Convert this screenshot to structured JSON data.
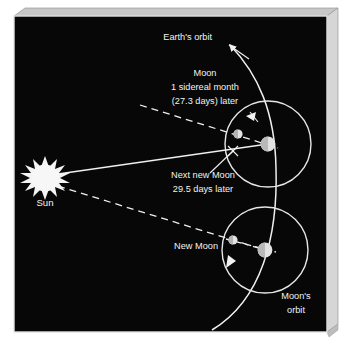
{
  "figure": {
    "kind": "astronomy-diagram",
    "panel": {
      "background_color": "#070707",
      "border_color": "#d9d9d9",
      "bevel_top_color": "#c9c9c9",
      "bevel_side_color": "#d3d3d3",
      "ink_color": "#f2f2f2"
    },
    "labels": {
      "earth_orbit": "Earth's orbit",
      "moon_line1": "Moon",
      "moon_line2": "1 sidereal month",
      "moon_line3": "(27.3 days) later",
      "next_new_moon_line1": "Next new Moon",
      "next_new_moon_line2": "29.5 days later",
      "sun": "Sun",
      "new_moon": "New Moon",
      "moons_orbit_line1": "Moon's",
      "moons_orbit_line2": "orbit"
    },
    "bodies": {
      "sun": {
        "name": "Sun",
        "cx": 45,
        "cy": 178,
        "r": 16,
        "style": "spiked-star",
        "color": "#f4f4f4"
      },
      "earth_upper": {
        "name": "Earth (one sidereal month later)",
        "cx": 268,
        "cy": 144,
        "r": 7.4,
        "color": "#e8e8e8"
      },
      "moon_upper": {
        "name": "Moon (one sidereal month later)",
        "cx": 238,
        "cy": 134,
        "r": 4.6,
        "color": "#e8e8e8"
      },
      "earth_lower": {
        "name": "Earth at new Moon",
        "cx": 265,
        "cy": 250,
        "r": 7.4,
        "color": "#e8e8e8"
      },
      "moon_lower": {
        "name": "New Moon",
        "cx": 233,
        "cy": 240,
        "r": 4.6,
        "color": "#e8e8e8"
      }
    },
    "orbits": {
      "moon_orbit_upper": {
        "cx": 268,
        "cy": 144,
        "r": 43
      },
      "moon_orbit_lower": {
        "cx": 265,
        "cy": 250,
        "r": 43
      },
      "earth_orbit_note": "tall arc curving from bottom of panel up past the two Earth positions to an arrowhead near the top"
    },
    "sight_lines": [
      {
        "name": "sun-to-earth-upper-solid",
        "style": "solid",
        "from": "sun",
        "to": "earth_upper"
      },
      {
        "name": "sun-to-moon-lower-dashed",
        "style": "dashed",
        "from": "sun",
        "to": "moon_lower"
      },
      {
        "name": "moon-upper-sightline-dashed",
        "style": "dashed",
        "note": "dashed line through upper Moon and Earth extending up-left"
      },
      {
        "name": "moon-lower-to-earth-dashed",
        "style": "dashed",
        "from": "moon_lower",
        "to": "earth_lower"
      },
      {
        "name": "next-new-moon-leader",
        "style": "solid",
        "note": "leader from text to crossing mark at (233,151)"
      }
    ],
    "direction_arrows": [
      {
        "name": "upper-orbit-direction",
        "at": [
          252,
          115
        ]
      },
      {
        "name": "lower-orbit-direction",
        "at": [
          232,
          262
        ]
      },
      {
        "name": "earth-orbit-direction",
        "at": [
          230,
          43
        ]
      }
    ]
  }
}
